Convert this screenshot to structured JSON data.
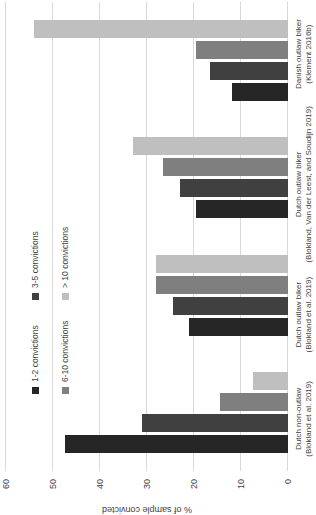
{
  "chart_data": {
    "type": "bar",
    "title": "",
    "ylabel": "% of sample convicted",
    "ylim": [
      0,
      60
    ],
    "yticks": [
      0,
      10,
      20,
      30,
      40,
      50,
      60
    ],
    "grid": "value gridlines on",
    "legend_position": "inside plot, upper area, 2 columns x 2 rows",
    "image_rotation_deg": -90,
    "categories": [
      {
        "line1": "Dutch non-outlaw",
        "line2": "(Blokland et al. 2019)"
      },
      {
        "line1": "Dutch outlaw biker",
        "line2": "(Blokland et al. 2019)"
      },
      {
        "line1": "Dutch outlaw biker",
        "line2": "(Blokland, Van der Leest, and Soudijn 2019)"
      },
      {
        "line1": "Danish outlaw biker",
        "line2": "(Klement 2016b)"
      }
    ],
    "series": [
      {
        "name": "1-2 convictions",
        "color": "#262626",
        "values": [
          47.5,
          21,
          19.5,
          12
        ]
      },
      {
        "name": "3-5 convictions",
        "color": "#404040",
        "values": [
          31,
          24.5,
          23,
          16.5
        ]
      },
      {
        "name": "6-10 convictions",
        "color": "#7f7f7f",
        "values": [
          14.5,
          28,
          26.5,
          19.5
        ]
      },
      {
        "name": "> 10 convictions",
        "color": "#bfbfbf",
        "values": [
          7.5,
          28,
          33,
          54
        ]
      }
    ]
  },
  "colors": {
    "background": "#ffffff",
    "gridline": "#d9d9d9",
    "axis_text": "#404040"
  }
}
